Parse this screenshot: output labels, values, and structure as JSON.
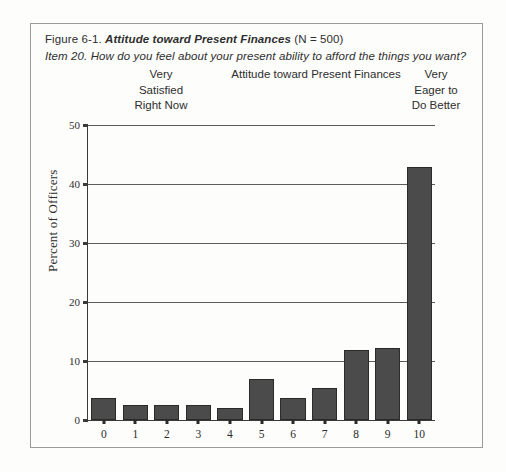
{
  "figure": {
    "number": "Figure 6-1.",
    "title": "Attitude toward Present Finances",
    "n_note": "(N = 500)",
    "item_line": "Item 20. How do you feel about your present ability to afford the things you want?"
  },
  "anchors": {
    "left": "Very\nSatisfied\nRight Now",
    "center": "Attitude toward Present Finances",
    "right": "Very\nEager to\nDo Better"
  },
  "chart_data": {
    "type": "bar",
    "title": "Attitude toward Present Finances",
    "xlabel": "",
    "ylabel": "Percent of Officers",
    "categories": [
      "0",
      "1",
      "2",
      "3",
      "4",
      "5",
      "6",
      "7",
      "8",
      "9",
      "10"
    ],
    "values": [
      3.8,
      2.6,
      2.6,
      2.6,
      2.1,
      7.0,
      3.8,
      5.5,
      11.8,
      12.2,
      42.8
    ],
    "ylim": [
      0,
      50
    ],
    "yticks": [
      0,
      10,
      20,
      30,
      40,
      50
    ],
    "ytick_labels": [
      "0",
      "10",
      "20",
      "30",
      "40",
      "50"
    ],
    "grid": "horizontal",
    "legend": "none",
    "bar_color": "#4b4b4b",
    "bar_edge_color": "#2a2a2a",
    "axis_color": "#3a3a38",
    "gridline_color": "#5c5c5a"
  }
}
